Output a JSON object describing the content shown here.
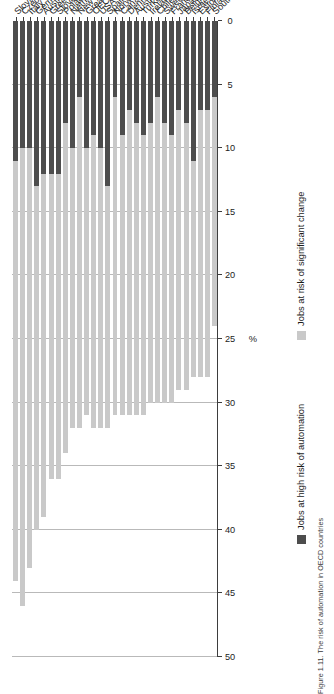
{
  "figure": {
    "caption": "Figure 1.11. The risk of automation in OECD countries"
  },
  "legend": {
    "position": "bottom",
    "items": [
      {
        "label": "Jobs at high risk of automation",
        "color": "#4d4d4d",
        "icon": "legend-swatch"
      },
      {
        "label": "Jobs at risk of significant change",
        "color": "#c9c9c9",
        "icon": "legend-swatch"
      }
    ]
  },
  "axes": {
    "value_axis_title": "%",
    "value_ticks": [
      "0",
      "5",
      "10",
      "15",
      "20",
      "25",
      "30",
      "35",
      "40",
      "45",
      "50"
    ]
  },
  "chart_data": {
    "type": "bar",
    "orientation": "horizontal-stacked",
    "title": "Figure 1.11. The risk of automation in OECD countries",
    "xlabel": "%",
    "ylabel": "",
    "xlim": [
      0,
      50
    ],
    "grid": true,
    "legend_position": "bottom",
    "categories": [
      "Slovakia",
      "Czech Republic",
      "Italy",
      "Germany",
      "Austria",
      "Greece",
      "Slovenia",
      "Poland",
      "Netherlands",
      "New Zealand",
      "Great Britain",
      "OECD",
      "USA",
      "Spain",
      "Norway",
      "Canada",
      "Denmark",
      "Australia",
      "Turkey",
      "Ireland",
      "Chile",
      "Sweden",
      "France",
      "Japan",
      "Belgium",
      "Israel",
      "Estonia",
      "Finland",
      "South Korea"
    ],
    "series": [
      {
        "name": "Jobs at high risk of automation",
        "color": "#4d4d4d",
        "values": [
          11,
          10,
          10,
          13,
          12,
          12,
          12,
          8,
          10,
          6,
          10,
          9,
          10,
          13,
          6,
          9,
          7,
          8,
          9,
          8,
          6,
          8,
          9,
          7,
          8,
          11,
          7,
          7,
          6
        ]
      },
      {
        "name": "Jobs at risk of significant change",
        "color": "#c9c9c9",
        "values": [
          33,
          36,
          33,
          27,
          27,
          24,
          24,
          26,
          22,
          26,
          21,
          23,
          22,
          19,
          25,
          22,
          24,
          23,
          22,
          22,
          24,
          22,
          21,
          22,
          21,
          17,
          21,
          21,
          18
        ]
      }
    ]
  }
}
